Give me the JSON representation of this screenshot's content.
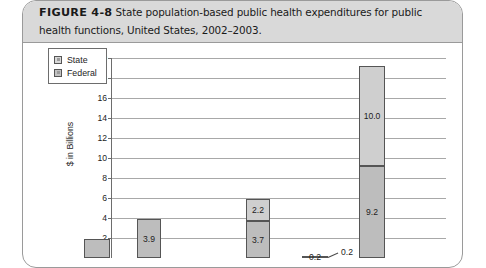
{
  "figure": {
    "label": "FIGURE 4-8",
    "caption": "State population-based public health expenditures for public health functions, United States, 2002–2003."
  },
  "legend": {
    "items": [
      {
        "name": "State",
        "swatch": "state-swatch-icon"
      },
      {
        "name": "Federal",
        "swatch": "federal-swatch-icon"
      }
    ]
  },
  "chart_data": {
    "type": "bar",
    "subtype": "stacked",
    "title": "State population-based public health expenditures for public health functions, United States, 2002–2003.",
    "xlabel": "",
    "ylabel": "$ in Billions",
    "ylim": [
      0,
      20
    ],
    "ytick_labels": [
      "20",
      "18",
      "16",
      "14",
      "12",
      "10",
      "8",
      "6",
      "4",
      "2"
    ],
    "ytick_values": [
      20,
      18,
      16,
      14,
      12,
      10,
      8,
      6,
      4,
      2
    ],
    "grid": true,
    "legend_position": "upper-left-inside",
    "categories": [
      "Category 1",
      "Category 2",
      "Category 3",
      "Category 4",
      "Category 5"
    ],
    "series": [
      {
        "name": "State",
        "values": [
          1.9,
          3.9,
          3.7,
          0.2,
          9.2
        ]
      },
      {
        "name": "Federal",
        "values": [
          null,
          null,
          2.2,
          null,
          10.0
        ]
      }
    ],
    "data_labels": {
      "bar1": {
        "state": "",
        "federal": ""
      },
      "bar2": {
        "state": "3.9",
        "federal": ""
      },
      "bar3": {
        "state": "3.7",
        "federal": "2.2"
      },
      "bar4": {
        "state": "0.2",
        "federal": ""
      },
      "bar5": {
        "state": "9.2",
        "federal": "10.0"
      }
    },
    "annotations": [
      {
        "text": "0.2",
        "target": "bar4",
        "style": "leader-line"
      }
    ],
    "note": "Bottom of chart including x-axis category labels is cropped off by the screenshot edge."
  },
  "colors": {
    "state_fill": "#bdbdbd",
    "federal_fill": "#cfcfcf",
    "bar_stroke": "#555555",
    "gridline": "#a8a8a8",
    "axis": "#6d6d6d",
    "caption_band": "#d9d9d9",
    "figure_border": "#9a9a9a"
  }
}
